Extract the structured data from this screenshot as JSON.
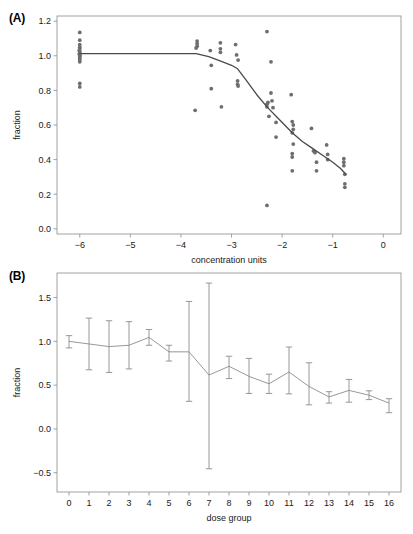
{
  "figure": {
    "panel_a_label": "(A)",
    "panel_b_label": "(B)"
  },
  "colors": {
    "point": "#6e6e6e",
    "curve": "#4a4a4a",
    "errorbar": "#8c8c8c",
    "frame": "#8a8a8a",
    "text": "#1a1a1a",
    "background": "#ffffff"
  },
  "chart_data": [
    {
      "type": "scatter",
      "panel": "(A)",
      "title": "",
      "xlabel": "concentration units",
      "ylabel": "fraction",
      "xlim": [
        -6.45,
        0.35
      ],
      "ylim": [
        -0.03,
        1.23
      ],
      "xticks": [
        -6,
        -5,
        -4,
        -3,
        -2,
        -1,
        0
      ],
      "xticklabels": [
        "−6",
        "−5",
        "−4",
        "−3",
        "−2",
        "−1",
        "0"
      ],
      "yticks": [
        0.0,
        0.2,
        0.4,
        0.6,
        0.8,
        1.0,
        1.2
      ],
      "yticklabels": [
        "0.0",
        "0.2",
        "0.4",
        "0.6",
        "0.8",
        "1.0",
        "1.2"
      ],
      "grid": false,
      "legend": "none",
      "points": [
        [
          -6.0,
          1.135
        ],
        [
          -6.0,
          1.09
        ],
        [
          -6.0,
          1.065
        ],
        [
          -6.0,
          1.05
        ],
        [
          -6.0,
          1.04
        ],
        [
          -6.0,
          1.025
        ],
        [
          -6.0,
          1.015
        ],
        [
          -6.0,
          1.005
        ],
        [
          -6.0,
          1.0
        ],
        [
          -6.0,
          0.995
        ],
        [
          -6.0,
          0.985
        ],
        [
          -6.0,
          0.975
        ],
        [
          -6.0,
          0.965
        ],
        [
          -6.01,
          1.03
        ],
        [
          -6.01,
          1.01
        ],
        [
          -6.0,
          0.84
        ],
        [
          -6.0,
          0.82
        ],
        [
          -3.68,
          1.085
        ],
        [
          -3.68,
          1.07
        ],
        [
          -3.68,
          1.055
        ],
        [
          -3.7,
          1.045
        ],
        [
          -3.72,
          0.685
        ],
        [
          -3.42,
          1.03
        ],
        [
          -3.4,
          0.945
        ],
        [
          -3.4,
          0.81
        ],
        [
          -3.22,
          1.075
        ],
        [
          -3.22,
          1.04
        ],
        [
          -3.22,
          1.02
        ],
        [
          -3.2,
          0.705
        ],
        [
          -2.92,
          1.065
        ],
        [
          -2.9,
          1.005
        ],
        [
          -2.87,
          0.975
        ],
        [
          -2.88,
          0.855
        ],
        [
          -2.88,
          0.835
        ],
        [
          -2.87,
          0.825
        ],
        [
          -2.3,
          1.14
        ],
        [
          -2.22,
          0.965
        ],
        [
          -2.3,
          0.72
        ],
        [
          -2.3,
          0.705
        ],
        [
          -2.28,
          0.73
        ],
        [
          -2.26,
          0.65
        ],
        [
          -2.22,
          0.785
        ],
        [
          -2.2,
          0.74
        ],
        [
          -2.18,
          0.7
        ],
        [
          -2.12,
          0.615
        ],
        [
          -2.12,
          0.53
        ],
        [
          -2.3,
          0.135
        ],
        [
          -1.82,
          0.775
        ],
        [
          -1.8,
          0.62
        ],
        [
          -1.78,
          0.6
        ],
        [
          -1.78,
          0.575
        ],
        [
          -1.8,
          0.555
        ],
        [
          -1.78,
          0.49
        ],
        [
          -1.8,
          0.435
        ],
        [
          -1.8,
          0.415
        ],
        [
          -1.8,
          0.335
        ],
        [
          -1.42,
          0.58
        ],
        [
          -1.38,
          0.45
        ],
        [
          -1.35,
          0.44
        ],
        [
          -1.32,
          0.385
        ],
        [
          -1.32,
          0.335
        ],
        [
          -1.12,
          0.485
        ],
        [
          -1.1,
          0.43
        ],
        [
          -1.1,
          0.4
        ],
        [
          -0.78,
          0.405
        ],
        [
          -0.78,
          0.385
        ],
        [
          -0.78,
          0.365
        ],
        [
          -0.76,
          0.315
        ],
        [
          -0.76,
          0.26
        ],
        [
          -0.76,
          0.24
        ]
      ],
      "fit_curve": [
        [
          -6.0,
          1.012
        ],
        [
          -5.0,
          1.012
        ],
        [
          -4.2,
          1.012
        ],
        [
          -3.7,
          1.012
        ],
        [
          -3.45,
          0.995
        ],
        [
          -3.2,
          0.968
        ],
        [
          -3.0,
          0.945
        ],
        [
          -2.88,
          0.925
        ],
        [
          -2.7,
          0.855
        ],
        [
          -2.5,
          0.775
        ],
        [
          -2.3,
          0.705
        ],
        [
          -2.1,
          0.645
        ],
        [
          -1.95,
          0.6
        ],
        [
          -1.8,
          0.555
        ],
        [
          -1.6,
          0.505
        ],
        [
          -1.4,
          0.465
        ],
        [
          -1.2,
          0.425
        ],
        [
          -1.0,
          0.385
        ],
        [
          -0.85,
          0.35
        ],
        [
          -0.74,
          0.315
        ]
      ]
    },
    {
      "type": "line",
      "panel": "(B)",
      "title": "",
      "xlabel": "dose group",
      "ylabel": "fraction",
      "xlim": [
        -0.6,
        16.6
      ],
      "ylim": [
        -0.72,
        1.78
      ],
      "xticks": [
        0,
        1,
        2,
        3,
        4,
        5,
        6,
        7,
        8,
        9,
        10,
        11,
        12,
        13,
        14,
        15,
        16
      ],
      "xticklabels": [
        "0",
        "1",
        "2",
        "3",
        "4",
        "5",
        "6",
        "7",
        "8",
        "9",
        "10",
        "11",
        "12",
        "13",
        "14",
        "15",
        "16"
      ],
      "yticks": [
        -0.5,
        0.0,
        0.5,
        1.0,
        1.5
      ],
      "yticklabels": [
        "−0.5",
        "0.0",
        "0.5",
        "1.0",
        "1.5"
      ],
      "grid": false,
      "legend": "none",
      "categories": [
        0,
        1,
        2,
        3,
        4,
        5,
        6,
        7,
        8,
        9,
        10,
        11,
        12,
        13,
        14,
        15,
        16
      ],
      "values": [
        1.0,
        0.97,
        0.94,
        0.955,
        1.045,
        0.88,
        0.88,
        0.615,
        0.715,
        0.6,
        0.515,
        0.65,
        0.485,
        0.365,
        0.44,
        0.385,
        0.295
      ],
      "err_low": [
        0.925,
        0.675,
        0.645,
        0.685,
        0.955,
        0.775,
        0.315,
        -0.455,
        0.575,
        0.405,
        0.405,
        0.4,
        0.275,
        0.295,
        0.305,
        0.335,
        0.185
      ],
      "err_high": [
        1.065,
        1.265,
        1.235,
        1.225,
        1.135,
        0.955,
        1.455,
        1.665,
        0.83,
        0.805,
        0.625,
        0.935,
        0.755,
        0.425,
        0.565,
        0.435,
        0.345
      ]
    }
  ]
}
